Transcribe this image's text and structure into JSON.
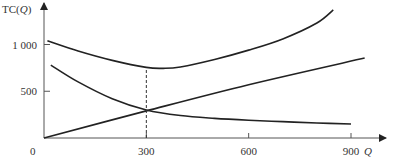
{
  "chart_data": {
    "type": "line",
    "title": "",
    "xlabel": "Q",
    "ylabel": "TC(Q)",
    "xlim": [
      0,
      1000
    ],
    "ylim": [
      0,
      1450
    ],
    "x_ticks": [
      300,
      600,
      900
    ],
    "x_tick_labels": [
      "300",
      "600",
      "900"
    ],
    "y_ticks": [
      500,
      1000
    ],
    "y_tick_labels": [
      "500",
      "1 000"
    ],
    "origin_label": "0",
    "grid": false,
    "legend": null,
    "series": [
      {
        "name": "upper U-shaped curve",
        "x": [
          10,
          100,
          200,
          300,
          350,
          400,
          500,
          600,
          700,
          800,
          848
        ],
        "y": [
          1040,
          930,
          830,
          755,
          745,
          760,
          840,
          940,
          1060,
          1230,
          1370
        ]
      },
      {
        "name": "linear curve",
        "x": [
          0,
          300,
          600,
          940
        ],
        "y": [
          0,
          290,
          570,
          855
        ]
      },
      {
        "name": "decreasing curve",
        "x": [
          20,
          100,
          200,
          300,
          400,
          500,
          600,
          700,
          800,
          900
        ],
        "y": [
          780,
          600,
          420,
          300,
          240,
          210,
          190,
          175,
          160,
          150
        ]
      }
    ],
    "annotations": [
      {
        "type": "dashed-vertical",
        "x": 300,
        "y_from": 0,
        "y_to": 750
      }
    ]
  }
}
